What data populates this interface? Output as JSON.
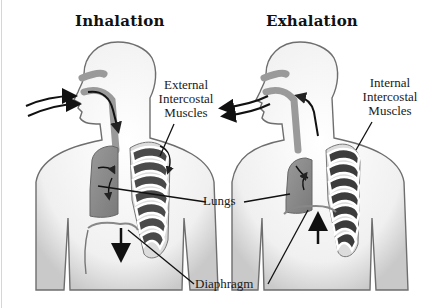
{
  "diagram": {
    "panels": [
      {
        "title": "Inhalation",
        "muscle_label": [
          "External",
          "Intercostal",
          "Muscles"
        ],
        "airflow_direction": "into mouth",
        "diaphragm_motion": "down"
      },
      {
        "title": "Exhalation",
        "muscle_label": [
          "Internal",
          "Intercostal",
          "Muscles"
        ],
        "airflow_direction": "out of mouth",
        "diaphragm_motion": "up"
      }
    ],
    "shared_labels": {
      "lungs": "Lungs",
      "diaphragm": "Diaphragm"
    },
    "colors": {
      "body_fill": "#f2f2f2",
      "body_outline": "#6e6e6e",
      "lung_fill": "#8c8c8c",
      "rib_dark": "#3c3c3c",
      "airway": "#9a9a9a",
      "arrow": "#111111"
    }
  }
}
